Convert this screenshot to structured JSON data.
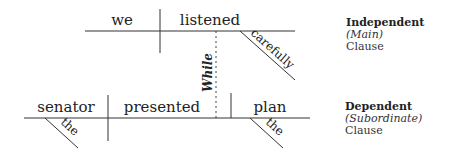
{
  "diagram": {
    "type": "sentence-diagram",
    "independent_clause": {
      "subject": "we",
      "verb": "listened",
      "modifiers": [
        "carefully"
      ]
    },
    "connector": "While",
    "dependent_clause": {
      "subject": "senator",
      "verb": "presented",
      "object": "plan",
      "modifiers": [
        "the",
        "the"
      ]
    }
  },
  "legend": {
    "independent": {
      "title": "Independent",
      "sub": "(Main)",
      "label": "Clause"
    },
    "dependent": {
      "title": "Dependent",
      "sub": "(Subordinate)",
      "label": "Clause"
    }
  },
  "colors": {
    "line": "#333333",
    "text": "#222222"
  }
}
